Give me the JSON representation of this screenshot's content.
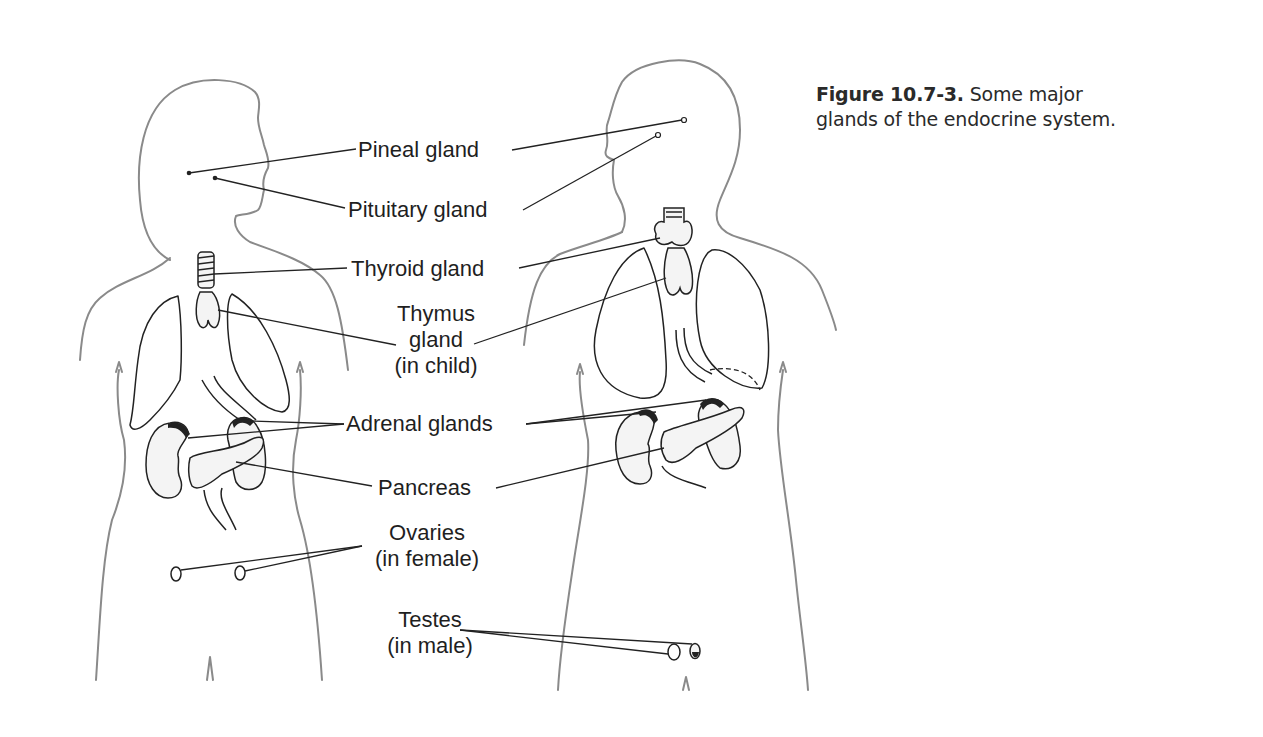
{
  "caption": {
    "figure_number": "Figure 10.7-3.",
    "line1_rest": " Some major",
    "line2": "glands of the endocrine system."
  },
  "labels": {
    "pineal": "Pineal gland",
    "pituitary": "Pituitary gland",
    "thyroid": "Thyroid gland",
    "thymus_line1": "Thymus",
    "thymus_line2": "gland",
    "thymus_line3": "(in child)",
    "adrenal": "Adrenal glands",
    "pancreas": "Pancreas",
    "ovaries_line1": "Ovaries",
    "ovaries_line2": "(in female)",
    "testes_line1": "Testes",
    "testes_line2": "(in male)"
  },
  "figures": {
    "left": "female-body-outline",
    "right": "male-body-outline"
  },
  "colors": {
    "outline": "#8a8a8a",
    "ink": "#222222",
    "text": "#1f1f1f"
  }
}
